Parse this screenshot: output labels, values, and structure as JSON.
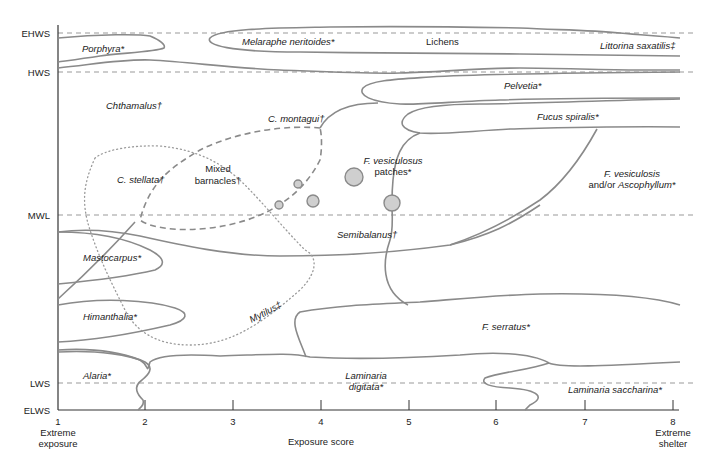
{
  "figure": {
    "type": "zonation-diagram",
    "x_axis": {
      "label": "Exposure score",
      "ticks": [
        "1",
        "2",
        "3",
        "4",
        "5",
        "6",
        "7",
        "8"
      ],
      "left_end_label": [
        "Extreme",
        "exposure"
      ],
      "right_end_label": [
        "Extreme",
        "shelter"
      ]
    },
    "y_axis": {
      "levels": [
        "EHWS",
        "HWS",
        "MWL",
        "LWS",
        "ELWS"
      ]
    },
    "zones": {
      "porphyra": "Porphyra*",
      "melaraphe": "Melaraphe neritoides*",
      "lichens": "Lichens",
      "littorina": "Littorina saxatilis‡",
      "chthamalus": "Chthamalus†",
      "pelvetia": "Pelvetia*",
      "c_montagui": "C. montagui†",
      "fucus_spiralis": "Fucus spiralis*",
      "c_stellata": "C. stellata†",
      "mixed_barnacles": [
        "Mixed",
        "barnacles†"
      ],
      "f_vesiculosus_patches": [
        "F. vesiculosus",
        "patches*"
      ],
      "f_vesiculosis_ascophyllum": [
        "F. vesiculosis",
        "and/or ",
        "Ascophyllum*"
      ],
      "semibalanus": "Semibalanus†",
      "mastocarpus": "Mastocarpus*",
      "mytilus": "Mytilus‡",
      "himanthalia": "Himanthalia*",
      "f_serratus": "F. serratus*",
      "alaria": "Alaria*",
      "laminaria_digitata": [
        "Laminaria",
        "digitata*"
      ],
      "laminaria_saccharina": "Laminaria saccharina*"
    },
    "colors": {
      "zone_outline": "#8a8a8a",
      "patch_fill": "#cfcfcf",
      "axis": "#333333"
    }
  }
}
